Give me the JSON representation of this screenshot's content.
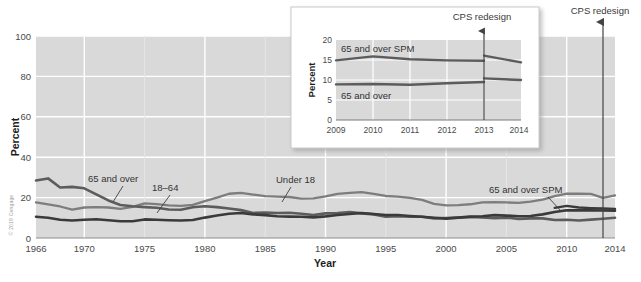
{
  "credit": "© 2019 Cengage",
  "chart_data": [
    {
      "id": "main",
      "type": "line",
      "title": "",
      "xlabel": "Year",
      "ylabel": "Percent",
      "xlim": [
        1966,
        2014
      ],
      "ylim": [
        0,
        100
      ],
      "yticks": [
        0,
        20,
        40,
        60,
        80,
        100
      ],
      "xticks": [
        1966,
        1970,
        1975,
        1980,
        1985,
        1990,
        1995,
        2000,
        2005,
        2010,
        2014
      ],
      "grid": true,
      "legend": "inline-labels",
      "annotations": [
        {
          "name": "cps-redesign",
          "text": "CPS redesign",
          "x": 2013
        }
      ],
      "series": [
        {
          "name": "65 and over",
          "color": "#5c5c5c",
          "label": "65 and over",
          "x": [
            1966,
            1967,
            1968,
            1969,
            1970,
            1971,
            1972,
            1973,
            1974,
            1975,
            1976,
            1977,
            1978,
            1979,
            1980,
            1981,
            1982,
            1983,
            1984,
            1985,
            1986,
            1987,
            1988,
            1989,
            1990,
            1991,
            1992,
            1993,
            1994,
            1995,
            1996,
            1997,
            1998,
            1999,
            2000,
            2001,
            2002,
            2003,
            2004,
            2005,
            2006,
            2007,
            2008,
            2009,
            2010,
            2011,
            2012,
            2013,
            2014
          ],
          "values": [
            28.5,
            29.5,
            25.0,
            25.3,
            24.6,
            21.6,
            18.6,
            16.3,
            15.7,
            15.3,
            15.0,
            14.1,
            14.0,
            15.2,
            15.7,
            15.3,
            14.6,
            13.8,
            12.4,
            12.6,
            12.4,
            12.5,
            12.0,
            11.4,
            12.2,
            12.4,
            12.9,
            12.2,
            11.7,
            10.5,
            10.8,
            10.5,
            10.5,
            9.7,
            9.9,
            10.1,
            10.4,
            10.2,
            9.8,
            10.1,
            9.4,
            9.7,
            9.7,
            8.9,
            9.0,
            8.7,
            9.1,
            9.5,
            10.0
          ]
        },
        {
          "name": "18-64",
          "color": "#3a3a3a",
          "label": "18–64",
          "x": [
            1966,
            1967,
            1968,
            1969,
            1970,
            1971,
            1972,
            1973,
            1974,
            1975,
            1976,
            1977,
            1978,
            1979,
            1980,
            1981,
            1982,
            1983,
            1984,
            1985,
            1986,
            1987,
            1988,
            1989,
            1990,
            1991,
            1992,
            1993,
            1994,
            1995,
            1996,
            1997,
            1998,
            1999,
            2000,
            2001,
            2002,
            2003,
            2004,
            2005,
            2006,
            2007,
            2008,
            2009,
            2010,
            2011,
            2012,
            2013,
            2014
          ],
          "values": [
            10.5,
            10.0,
            9.0,
            8.7,
            9.0,
            9.3,
            8.8,
            8.3,
            8.3,
            9.2,
            9.0,
            8.8,
            8.7,
            8.9,
            10.1,
            11.1,
            12.0,
            12.4,
            11.7,
            11.3,
            10.8,
            10.6,
            10.5,
            10.2,
            10.7,
            11.4,
            11.9,
            12.4,
            11.9,
            11.4,
            11.4,
            10.9,
            10.5,
            10.0,
            9.6,
            10.1,
            10.6,
            10.8,
            11.3,
            11.1,
            10.8,
            10.9,
            11.7,
            12.9,
            13.7,
            13.7,
            13.7,
            13.6,
            13.5
          ]
        },
        {
          "name": "Under 18",
          "color": "#7d7d7d",
          "label": "Under 18",
          "x": [
            1966,
            1967,
            1968,
            1969,
            1970,
            1971,
            1972,
            1973,
            1974,
            1975,
            1976,
            1977,
            1978,
            1979,
            1980,
            1981,
            1982,
            1983,
            1984,
            1985,
            1986,
            1987,
            1988,
            1989,
            1990,
            1991,
            1992,
            1993,
            1994,
            1995,
            1996,
            1997,
            1998,
            1999,
            2000,
            2001,
            2002,
            2003,
            2004,
            2005,
            2006,
            2007,
            2008,
            2009,
            2010,
            2011,
            2012,
            2013,
            2014
          ],
          "values": [
            17.6,
            16.6,
            15.6,
            14.0,
            15.1,
            15.3,
            15.1,
            14.4,
            15.4,
            17.1,
            16.8,
            16.2,
            15.9,
            16.4,
            18.3,
            20.0,
            21.9,
            22.3,
            21.5,
            20.7,
            20.5,
            20.3,
            19.5,
            19.6,
            20.6,
            21.8,
            22.3,
            22.7,
            21.8,
            20.8,
            20.5,
            19.9,
            18.9,
            16.9,
            16.2,
            16.3,
            16.7,
            17.6,
            17.8,
            17.6,
            17.4,
            18.0,
            19.0,
            20.7,
            22.0,
            21.9,
            21.8,
            19.9,
            21.1
          ]
        },
        {
          "name": "65 and over SPM",
          "color": "#3a3a3a",
          "label": "65 and over SPM",
          "x": [
            2009,
            2010,
            2011,
            2012,
            2013,
            2014
          ],
          "values": [
            14.9,
            15.9,
            15.1,
            14.8,
            14.6,
            14.4
          ]
        }
      ]
    },
    {
      "id": "inset",
      "type": "line",
      "title": "",
      "xlabel": "",
      "ylabel": "Percent",
      "xlim": [
        2009,
        2014
      ],
      "ylim": [
        0,
        20
      ],
      "yticks": [
        0,
        5,
        10,
        15,
        20
      ],
      "xticks": [
        2009,
        2010,
        2011,
        2012,
        2013,
        2014
      ],
      "grid": true,
      "annotations": [
        {
          "name": "cps-redesign",
          "text": "CPS redesign",
          "x": 2013
        }
      ],
      "series": [
        {
          "name": "65 and over SPM",
          "color": "#5c5c5c",
          "label": "65 and over SPM",
          "x": [
            2009,
            2010,
            2011,
            2012,
            2013
          ],
          "values": [
            14.9,
            15.9,
            15.2,
            14.9,
            14.8
          ]
        },
        {
          "name": "65 and over SPM post-redesign",
          "color": "#5c5c5c",
          "label": "",
          "x": [
            2013,
            2014
          ],
          "values": [
            16.1,
            14.4
          ]
        },
        {
          "name": "65 and over",
          "color": "#5c5c5c",
          "label": "65 and over",
          "x": [
            2009,
            2010,
            2011,
            2012,
            2013
          ],
          "values": [
            8.9,
            9.0,
            8.8,
            9.2,
            9.5
          ]
        },
        {
          "name": "65 and over post-redesign",
          "color": "#5c5c5c",
          "label": "",
          "x": [
            2013,
            2014
          ],
          "values": [
            10.4,
            10.0
          ]
        }
      ]
    }
  ],
  "main": {
    "ylabel": "Percent",
    "xlabel": "Year",
    "yticks": [
      "100",
      "80",
      "60",
      "40",
      "20",
      "0"
    ],
    "xticks": [
      "1966",
      "1970",
      "1975",
      "1980",
      "1985",
      "1990",
      "1995",
      "2000",
      "2005",
      "2010",
      "2014"
    ],
    "labels": {
      "s65": "65 and over",
      "s1864": "18–64",
      "under18": "Under 18",
      "spm": "65 and over SPM"
    },
    "annotation": "CPS redesign"
  },
  "inset": {
    "ylabel": "Percent",
    "yticks": [
      "20",
      "15",
      "10",
      "5",
      "0"
    ],
    "xticks": [
      "2009",
      "2010",
      "2011",
      "2012",
      "2013",
      "2014"
    ],
    "labels": {
      "spm": "65 and over SPM",
      "s65": "65 and over"
    },
    "annotation": "CPS redesign"
  },
  "colors": {
    "plot_background": "#d9d9d9",
    "grid": "#ffffff",
    "series_65_over": "#5c5c5c",
    "series_18_64": "#3a3a3a",
    "series_under_18": "#7d7d7d",
    "series_spm": "#3a3a3a",
    "annotation_line": "#444444"
  }
}
